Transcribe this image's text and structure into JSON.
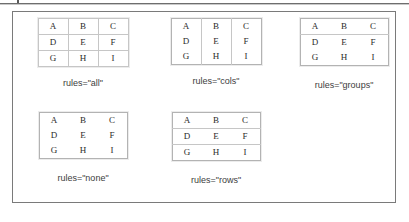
{
  "figure": {
    "kind": "html-table-rules-attribute-illustration",
    "grid_letters": [
      [
        "A",
        "B",
        "C"
      ],
      [
        "D",
        "E",
        "F"
      ],
      [
        "G",
        "H",
        "I"
      ]
    ],
    "examples": [
      {
        "id": "all",
        "rules": "all",
        "caption": "rules=\"all\"",
        "lines": "all internal row and column rules"
      },
      {
        "id": "cols",
        "rules": "cols",
        "caption": "rules=\"cols\"",
        "lines": "vertical column rules only"
      },
      {
        "id": "groups",
        "rules": "groups",
        "caption": "rules=\"groups\"",
        "lines": "rule between row groups only"
      },
      {
        "id": "none",
        "rules": "none",
        "caption": "rules=\"none\"",
        "lines": "no internal rules"
      },
      {
        "id": "rows",
        "rules": "rows",
        "caption": "rules=\"rows\"",
        "lines": "horizontal row rules only"
      }
    ]
  },
  "colors": {
    "page_background": "#ffffff",
    "frame_border": "#7a7a7a",
    "table_outer_border": "#b3b3b3",
    "table_rule": "#c6c6c6",
    "cell_text": "#2b2b2b",
    "caption_text": "#3d3d3d",
    "top_rule": "#6e6e6e"
  }
}
